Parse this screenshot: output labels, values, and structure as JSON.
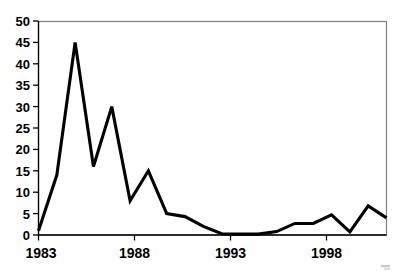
{
  "chart_data": {
    "type": "line",
    "title": "",
    "xlabel": "",
    "ylabel": "",
    "x": [
      1983,
      1984,
      1985,
      1986,
      1987,
      1988,
      1989,
      1990,
      1991,
      1992,
      1993,
      1994,
      1995,
      1996,
      1997,
      1998,
      1999,
      2000,
      2001,
      2002
    ],
    "values": [
      1,
      14,
      45,
      16,
      30,
      8,
      15,
      5,
      4.3,
      2,
      0.3,
      0.2,
      0.2,
      0.8,
      2.7,
      2.7,
      4.7,
      0.7,
      6.8,
      4
    ],
    "series": [
      {
        "name": "series-1",
        "values": [
          1,
          14,
          45,
          16,
          30,
          8,
          15,
          5,
          4.3,
          2,
          0.3,
          0.2,
          0.2,
          0.8,
          2.7,
          2.7,
          4.7,
          0.7,
          6.8,
          4
        ]
      }
    ],
    "xlim": [
      1983,
      2002
    ],
    "ylim": [
      0,
      50
    ],
    "yticks": [
      0,
      5,
      10,
      15,
      20,
      25,
      30,
      35,
      40,
      45,
      50
    ],
    "ytick_labels": [
      "0",
      "5",
      "10",
      "15",
      "20",
      "25",
      "30",
      "35",
      "40",
      "45",
      "50"
    ],
    "xticks": [
      1983,
      1988,
      1993,
      1998
    ],
    "xtick_labels": [
      "1983",
      "1988",
      "1993",
      "1998"
    ],
    "grid": false,
    "legend": false,
    "legend_position": "none",
    "line_color": "#000000",
    "border_color": "#808080",
    "background_color": "#ffffff"
  }
}
